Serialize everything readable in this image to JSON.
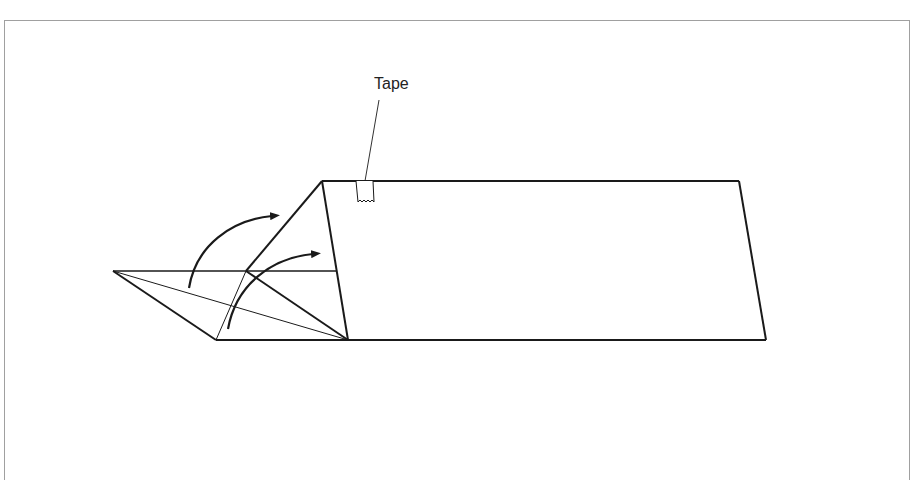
{
  "diagram": {
    "type": "origami-folding-instruction",
    "labels": {
      "tape": "Tape"
    },
    "colors": {
      "stroke": "#1a1a1a",
      "frame": "#a0a0a0",
      "background": "#ffffff"
    },
    "elements": [
      {
        "name": "paper-rectangle",
        "description": "Parallelogram-shaped paper body on the right"
      },
      {
        "name": "folded-flap",
        "description": "Triangular flap on the left being folded over"
      },
      {
        "name": "fold-arrow-outer",
        "description": "Curved arrow indicating the outer fold direction"
      },
      {
        "name": "fold-arrow-inner",
        "description": "Curved arrow indicating the inner fold direction"
      },
      {
        "name": "tape-strip",
        "description": "Small piece of tape at top edge of the paper"
      }
    ]
  }
}
